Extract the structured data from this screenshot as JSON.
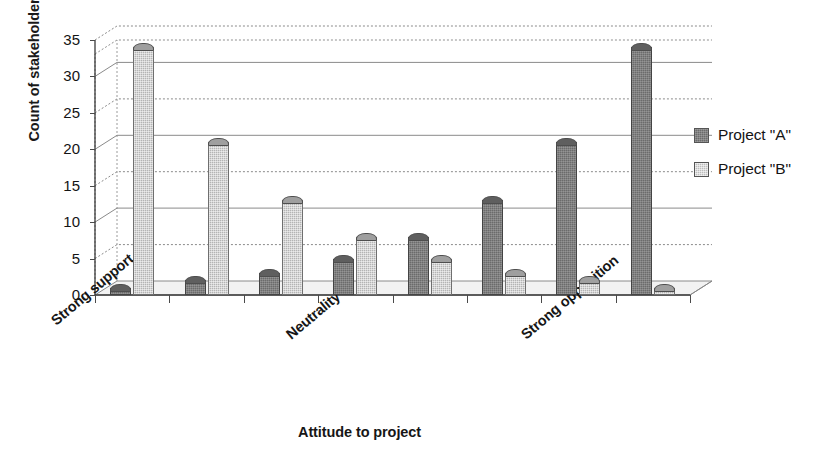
{
  "chart_data": {
    "type": "bar",
    "title": "",
    "subtitle": "",
    "xlabel": "Attitude to project",
    "ylabel": "Count of stakeholders",
    "categories": [
      "Strong support",
      "",
      "",
      "Neutrality",
      "",
      "",
      "",
      "Strong opposition"
    ],
    "category_tick_labels_visible": [
      "Strong support",
      "Neutrality",
      "Strong opposition"
    ],
    "visible_tick_label_indices": [
      0,
      3,
      7
    ],
    "series": [
      {
        "name": "Project \"A\"",
        "values": [
          1,
          2,
          3,
          5,
          8,
          13,
          21,
          34
        ],
        "color": "#6b6b6b",
        "pattern": "dark-checker"
      },
      {
        "name": "Project \"B\"",
        "values": [
          34,
          21,
          13,
          8,
          5,
          3,
          2,
          1
        ],
        "color": "#b4b4b4",
        "pattern": "light-checker"
      }
    ],
    "ylim": [
      0,
      35
    ],
    "yticks": [
      0,
      5,
      10,
      15,
      20,
      25,
      30,
      35
    ],
    "ytick_labels": [
      "0",
      "5",
      "10",
      "15",
      "20",
      "25",
      "30",
      "35"
    ],
    "grid": true,
    "grid_axis": "y",
    "legend_position": "right",
    "style": "3d-column",
    "background": "#ffffff"
  },
  "legend": {
    "entries": [
      {
        "label": "Project \"A\"",
        "swatch": "dark"
      },
      {
        "label": "Project \"B\"",
        "swatch": "light"
      }
    ]
  },
  "axes": {
    "y_title": "Count of stakeholders",
    "x_title": "Attitude to project"
  }
}
